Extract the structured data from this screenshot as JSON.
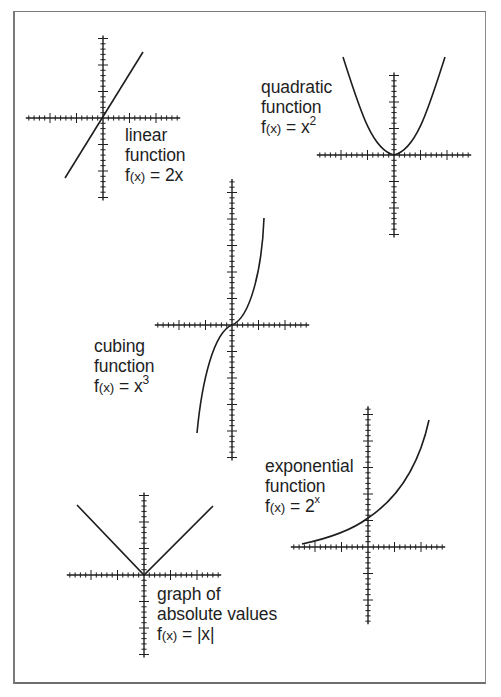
{
  "figure": {
    "frame_color": "#7a7a7a",
    "ink_color": "#1e1e1e"
  },
  "graphs": [
    {
      "id": "linear",
      "name_lines": [
        "linear",
        "function"
      ],
      "formula": {
        "prefix": "f",
        "arg": "(x)",
        "eq": " = ",
        "base": "2x",
        "sup": ""
      },
      "expression": "f(x) = 2x",
      "origin": [
        103,
        118
      ],
      "x_ticks_left": 14,
      "x_ticks_right": 14,
      "y_ticks_up": 15,
      "y_ticks_down": 15,
      "tick_px": 5.3,
      "label_pos": [
        125,
        125
      ]
    },
    {
      "id": "quadratic",
      "name_lines": [
        "quadratic",
        "function"
      ],
      "formula": {
        "prefix": "f",
        "arg": "(x)",
        "eq": " = ",
        "base": "x",
        "sup": "2"
      },
      "expression": "f(x) = x^2",
      "origin": [
        394,
        155
      ],
      "x_ticks_left": 14,
      "x_ticks_right": 14,
      "y_ticks_up": 15,
      "y_ticks_down": 15,
      "tick_px": 5.3,
      "label_pos": [
        261,
        77
      ]
    },
    {
      "id": "cubing",
      "name_lines": [
        "cubing",
        "function"
      ],
      "formula": {
        "prefix": "f",
        "arg": "(x)",
        "eq": " = ",
        "base": "x",
        "sup": "3"
      },
      "expression": "f(x) = x^3",
      "origin": [
        232,
        325
      ],
      "x_ticks_left": 14,
      "x_ticks_right": 14,
      "y_ticks_up": 27,
      "y_ticks_down": 25,
      "tick_px": 5.3,
      "label_pos": [
        94,
        336
      ]
    },
    {
      "id": "exponential",
      "name_lines": [
        "exponential",
        "function"
      ],
      "formula": {
        "prefix": "f",
        "arg": "(x)",
        "eq": " = ",
        "base": "2",
        "sup": "x"
      },
      "expression": "f(x) = 2^x",
      "origin": [
        368,
        547
      ],
      "x_ticks_left": 14,
      "x_ticks_right": 14,
      "y_ticks_up": 26,
      "y_ticks_down": 14,
      "tick_px": 5.3,
      "label_pos": [
        265,
        456
      ]
    },
    {
      "id": "absolute",
      "name_lines": [
        "graph of",
        "absolute values"
      ],
      "formula": {
        "prefix": "f",
        "arg": "(x)",
        "eq": " = ",
        "base": "|x|",
        "sup": ""
      },
      "expression": "f(x) = |x|",
      "origin": [
        144,
        575
      ],
      "x_ticks_left": 14,
      "x_ticks_right": 14,
      "y_ticks_up": 15,
      "y_ticks_down": 15,
      "tick_px": 5.3,
      "label_pos": [
        157,
        584
      ]
    }
  ],
  "chart_data": [
    {
      "type": "line",
      "title": "linear function f(x) = 2x",
      "x": [
        -1.5,
        -1,
        -0.5,
        0,
        0.5,
        1,
        1.5
      ],
      "values": [
        -3,
        -2,
        -1,
        0,
        1,
        2,
        3
      ],
      "grid": false,
      "axes": "cross at origin, minor ticks every unit/5, major every 5 ticks"
    },
    {
      "type": "line",
      "title": "quadratic function f(x) = x^2",
      "x": [
        -2,
        -1.5,
        -1,
        -0.5,
        0,
        0.5,
        1,
        1.5,
        2
      ],
      "values": [
        4,
        2.25,
        1,
        0.25,
        0,
        0.25,
        1,
        2.25,
        4
      ],
      "grid": false
    },
    {
      "type": "line",
      "title": "cubing function f(x) = x^3",
      "x": [
        -1.5,
        -1,
        -0.5,
        0,
        0.5,
        1,
        1.5
      ],
      "values": [
        -3.375,
        -1,
        -0.125,
        0,
        0.125,
        1,
        3.375
      ],
      "grid": false
    },
    {
      "type": "line",
      "title": "exponential function f(x) = 2^x",
      "x": [
        -3,
        -2,
        -1,
        0,
        1,
        2
      ],
      "values": [
        0.125,
        0.25,
        0.5,
        1,
        2,
        4
      ],
      "grid": false
    },
    {
      "type": "line",
      "title": "graph of absolute values f(x) = |x|",
      "x": [
        -2.5,
        -1,
        0,
        1,
        2.5
      ],
      "values": [
        2.5,
        1,
        0,
        1,
        2.5
      ],
      "grid": false
    }
  ]
}
